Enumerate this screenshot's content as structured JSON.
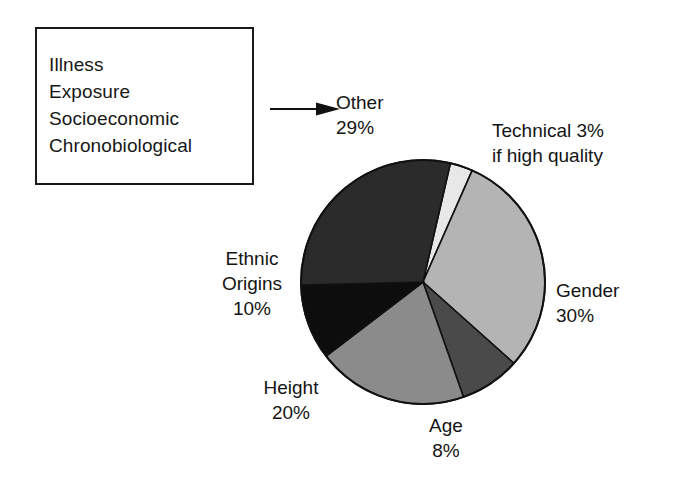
{
  "other_box": {
    "lines": [
      "Illness",
      "Exposure",
      "Socioeconomic",
      "Chronobiological"
    ]
  },
  "arrow": {
    "name": "arrow-right",
    "target": "Other"
  },
  "labels": {
    "other": {
      "line1": "Other",
      "line2": "29%"
    },
    "technical": {
      "line1": "Technical 3%",
      "line2": "if high quality"
    },
    "gender": {
      "line1": "Gender",
      "line2": "30%"
    },
    "age": {
      "line1": "Age",
      "line2": "8%"
    },
    "height": {
      "line1": "Height",
      "line2": "20%"
    },
    "ethnic": {
      "line1": "Ethnic",
      "line2": "Origins",
      "line3": "10%"
    }
  },
  "chart_data": {
    "type": "pie",
    "title": "",
    "xlabel": "",
    "ylabel": "",
    "legend_position": "none",
    "grid": false,
    "start_angle_deg": -77,
    "direction": "clockwise",
    "center_px": [
      423,
      282
    ],
    "radius_px": 122,
    "labels": [
      "Technical",
      "Gender",
      "Age",
      "Height",
      "Ethnic Origins",
      "Other"
    ],
    "values": [
      3,
      30,
      8,
      20,
      10,
      29
    ],
    "value_unit": "%",
    "total": 100,
    "colors": [
      "#e8e8e8",
      "#b4b4b4",
      "#4a4a4a",
      "#8b8b8b",
      "#0d0d0d",
      "#2b2b2b"
    ],
    "slices": [
      {
        "label": "Technical",
        "value": 3,
        "display": "Technical 3%",
        "note": "if high quality",
        "color": "#e8e8e8"
      },
      {
        "label": "Gender",
        "value": 30,
        "display": "Gender 30%",
        "color": "#b4b4b4"
      },
      {
        "label": "Age",
        "value": 8,
        "display": "Age 8%",
        "color": "#4a4a4a"
      },
      {
        "label": "Height",
        "value": 20,
        "display": "Height 20%",
        "color": "#8b8b8b"
      },
      {
        "label": "Ethnic Origins",
        "value": 10,
        "display": "Ethnic Origins 10%",
        "color": "#0d0d0d"
      },
      {
        "label": "Other",
        "value": 29,
        "display": "Other 29%",
        "color": "#2b2b2b",
        "components": [
          "Illness",
          "Exposure",
          "Socioeconomic",
          "Chronobiological"
        ]
      }
    ],
    "stroke_color": "#111111"
  }
}
